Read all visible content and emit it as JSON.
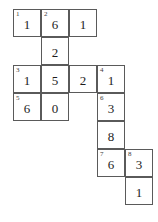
{
  "puzzle": {
    "type": "number-crossword",
    "grid": {
      "columns": 5,
      "rows": 7,
      "cell_size_px": 28,
      "origin_x_px": 13,
      "origin_y_px": 9,
      "border_color": "#5a5a5a",
      "background_color": "#ffffff",
      "digit_color": "#1c1c1c",
      "clue_number_color": "#3a3a3a"
    },
    "cells": [
      {
        "row": 1,
        "col": 1,
        "clue": "1",
        "value": "1"
      },
      {
        "row": 1,
        "col": 2,
        "clue": "2",
        "value": "6"
      },
      {
        "row": 1,
        "col": 3,
        "clue": "",
        "value": "1"
      },
      {
        "row": 2,
        "col": 2,
        "clue": "",
        "value": "2"
      },
      {
        "row": 3,
        "col": 1,
        "clue": "3",
        "value": "1"
      },
      {
        "row": 3,
        "col": 2,
        "clue": "",
        "value": "5"
      },
      {
        "row": 3,
        "col": 3,
        "clue": "",
        "value": "2"
      },
      {
        "row": 3,
        "col": 4,
        "clue": "4",
        "value": "1"
      },
      {
        "row": 4,
        "col": 1,
        "clue": "5",
        "value": "6"
      },
      {
        "row": 4,
        "col": 2,
        "clue": "",
        "value": "0"
      },
      {
        "row": 4,
        "col": 4,
        "clue": "6",
        "value": "3"
      },
      {
        "row": 5,
        "col": 4,
        "clue": "",
        "value": "8"
      },
      {
        "row": 6,
        "col": 4,
        "clue": "7",
        "value": "6"
      },
      {
        "row": 6,
        "col": 5,
        "clue": "8",
        "value": "3"
      },
      {
        "row": 7,
        "col": 5,
        "clue": "",
        "value": "1"
      }
    ]
  }
}
